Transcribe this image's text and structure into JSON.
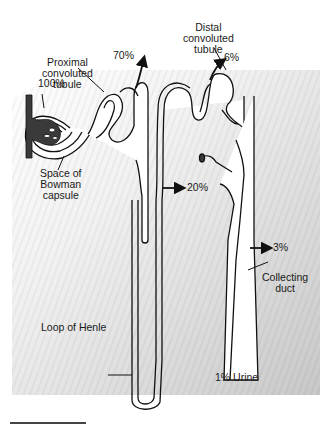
{
  "figure": {
    "labels": {
      "proximal": [
        "Proximal",
        "convoluted",
        "tubule"
      ],
      "distal": [
        "Distal",
        "convoluted",
        "tubule"
      ],
      "bowman": [
        "Space of",
        "Bowman",
        "capsule"
      ],
      "loop": "Loop of Henle",
      "collecting": [
        "Collecting",
        "duct"
      ]
    },
    "percentages": {
      "filtered": "100%",
      "proximal": "70%",
      "distal": "6%",
      "loop": "20%",
      "collecting": "3%",
      "urine": "1% Urine"
    },
    "colors": {
      "outline": "#111111",
      "vessel": "#3a3a3a",
      "tissue": "#cfcfcf",
      "lumen": "#ffffff"
    }
  }
}
